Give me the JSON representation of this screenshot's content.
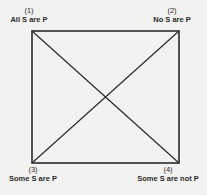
{
  "diagram": {
    "type": "square-of-opposition",
    "line_color": "#2a2a2a",
    "background": "#f2f2f0",
    "corners": [
      {
        "position": "top-left",
        "number": "(1)",
        "label": "All S are P"
      },
      {
        "position": "top-right",
        "number": "(2)",
        "label": "No S are P"
      },
      {
        "position": "bottom-left",
        "number": "(3)",
        "label": "Some S are P"
      },
      {
        "position": "bottom-right",
        "number": "(4)",
        "label": "Some S are not P"
      }
    ]
  }
}
